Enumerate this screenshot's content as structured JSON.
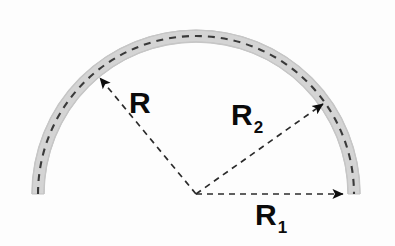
{
  "figure": {
    "type": "geometry-diagram",
    "background_color": "#fdfdfd",
    "band": {
      "name": "semicircular-arc-band",
      "fill_color": "#d2d2d2",
      "edge_color": "#bdbdbd",
      "center": {
        "x": 196,
        "y": 194
      },
      "centerline_radius": 158,
      "thickness": 12,
      "start_angle_deg": 0,
      "end_angle_deg": 180,
      "centerline": {
        "color": "#3a3a3a",
        "style": "dashed",
        "dash": "7 6",
        "width": 2
      }
    },
    "dimensions": [
      {
        "id": "R",
        "label": "R",
        "subscript": "",
        "from": {
          "x": 196,
          "y": 194
        },
        "to": {
          "x": 98,
          "y": 76
        },
        "angle_deg": 130,
        "line_color": "#2b2b2b",
        "line_style": "dashed",
        "arrow": "single-end"
      },
      {
        "id": "R2",
        "label": "R",
        "subscript": "2",
        "from": {
          "x": 196,
          "y": 194
        },
        "to": {
          "x": 325,
          "y": 102
        },
        "angle_deg": 35,
        "line_color": "#2b2b2b",
        "line_style": "dashed",
        "arrow": "single-end"
      },
      {
        "id": "R1",
        "label": "R",
        "subscript": "1",
        "from": {
          "x": 196,
          "y": 194
        },
        "to": {
          "x": 345,
          "y": 194
        },
        "angle_deg": 0,
        "line_color": "#2b2b2b",
        "line_style": "dashed",
        "arrow": "single-end"
      }
    ],
    "labels": {
      "R": {
        "text": "R",
        "sub": ""
      },
      "R2": {
        "text": "R",
        "sub": "2"
      },
      "R1": {
        "text": "R",
        "sub": "1"
      }
    }
  }
}
